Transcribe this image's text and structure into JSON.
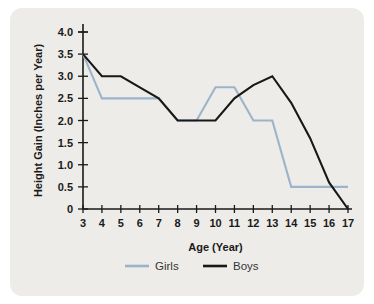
{
  "chart_data": {
    "type": "line",
    "title": "",
    "xlabel": "Age (Year)",
    "ylabel": "Height Gain (Inches per Year)",
    "x": [
      3,
      4,
      5,
      6,
      7,
      8,
      9,
      10,
      11,
      12,
      13,
      14,
      15,
      16,
      17
    ],
    "xticklabels": [
      "3",
      "4",
      "5",
      "6",
      "7",
      "8",
      "9",
      "10",
      "11",
      "12",
      "13",
      "14",
      "15",
      "16",
      "17"
    ],
    "yticklabels": [
      "4.0",
      "3.5",
      "3.0",
      "2.5",
      "2.0",
      "1.5",
      "1.0",
      "0.5",
      "0"
    ],
    "yticks": [
      4.0,
      3.5,
      3.0,
      2.5,
      2.0,
      1.5,
      1.0,
      0.5,
      0
    ],
    "xlim": [
      3,
      17
    ],
    "ylim": [
      0,
      4.0
    ],
    "grid": false,
    "legend_position": "bottom",
    "series": [
      {
        "name": "Girls",
        "color": "#9cb4cb",
        "values": [
          3.5,
          2.5,
          2.5,
          2.5,
          2.5,
          2.0,
          2.0,
          2.75,
          2.75,
          2.0,
          2.0,
          0.5,
          0.5,
          0.5,
          0.5
        ]
      },
      {
        "name": "Boys",
        "color": "#181818",
        "values": [
          3.5,
          3.0,
          3.0,
          2.75,
          2.5,
          2.0,
          2.0,
          2.0,
          2.5,
          2.8,
          3.0,
          2.4,
          1.6,
          0.6,
          0.0
        ]
      }
    ]
  },
  "legend": {
    "items": [
      {
        "label": "Girls",
        "color": "#9cb4cb"
      },
      {
        "label": "Boys",
        "color": "#181818"
      }
    ]
  },
  "colors": {
    "panel_background": "#edece8",
    "page_background": "#ffffff",
    "axis": "#1a1a1a",
    "girls_series": "#9cb4cb",
    "boys_series": "#181818"
  }
}
